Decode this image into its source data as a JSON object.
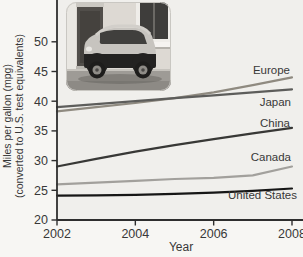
{
  "figure": {
    "x_axis_label": "Year",
    "y_axis_label_line1": "Miles per gallon (mpg)",
    "y_axis_label_line2": "(converted to U.S. test equivalents)"
  },
  "chart_data": {
    "type": "line",
    "title": "",
    "xlabel": "Year",
    "ylabel": "Miles per gallon (mpg) (converted to U.S. test equivalents)",
    "x": [
      2002,
      2003,
      2004,
      2005,
      2006,
      2007,
      2008
    ],
    "x_ticks": [
      2002,
      2004,
      2006,
      2008
    ],
    "y_ticks": [
      20,
      25,
      30,
      35,
      40,
      45,
      50
    ],
    "xlim": [
      2002,
      2008
    ],
    "ylim": [
      20,
      50
    ],
    "grid": false,
    "legend_position": "inline-labels-right",
    "series": [
      {
        "name": "Europe",
        "values": [
          38.3,
          39.0,
          39.7,
          40.5,
          41.5,
          42.7,
          44.0
        ],
        "color": "#8f8a80",
        "label_x": 290,
        "label_y": 74,
        "label_anchor": "end"
      },
      {
        "name": "Japan",
        "values": [
          39.0,
          39.5,
          40.0,
          40.5,
          41.0,
          41.5,
          42.0
        ],
        "color": "#5d5d5b",
        "label_x": 291,
        "label_y": 106,
        "label_anchor": "end"
      },
      {
        "name": "China",
        "values": [
          29.0,
          30.3,
          31.5,
          32.6,
          33.6,
          34.6,
          35.5
        ],
        "color": "#383836",
        "label_x": 290,
        "label_y": 127,
        "label_anchor": "end"
      },
      {
        "name": "Canada",
        "values": [
          26.0,
          26.3,
          26.6,
          26.9,
          27.1,
          27.5,
          29.0
        ],
        "color": "#a2a09c",
        "label_x": 291,
        "label_y": 161,
        "label_anchor": "end"
      },
      {
        "name": "United States",
        "values": [
          24.1,
          24.15,
          24.25,
          24.4,
          24.6,
          24.9,
          25.3
        ],
        "color": "#161616",
        "label_x": 297,
        "label_y": 199,
        "label_anchor": "end"
      }
    ]
  },
  "inset_photo": {
    "name": "smart-car-street-photo"
  },
  "colors": {
    "page_background": "#f7f6f3",
    "plot_background": "#f0efec",
    "axis": "#2e2e2e",
    "tick_text": "#383838",
    "label_text": "#3a3a3a"
  }
}
